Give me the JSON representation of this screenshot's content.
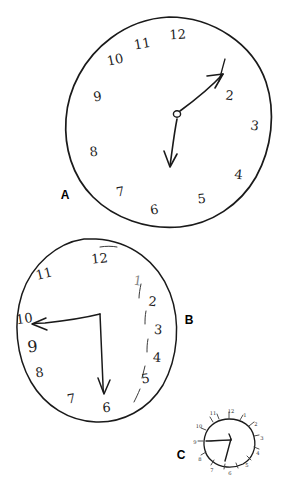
{
  "figure": {
    "background_color": "#ffffff",
    "ink_color": "#1a1a1a",
    "panels": [
      {
        "label": "A",
        "label_x": 65,
        "label_y": 199,
        "shape": "circle",
        "numbers": [
          "12",
          "1",
          "2",
          "3",
          "4",
          "5",
          "6",
          "7",
          "8",
          "9",
          "10",
          "11"
        ],
        "hands": [
          "long hand to 1",
          "short hand to 6"
        ],
        "hand_style": "arrow"
      },
      {
        "label": "B",
        "label_x": 189,
        "label_y": 324,
        "shape": "oval",
        "numbers": [
          "12",
          "1",
          "2",
          "3",
          "4",
          "5",
          "6",
          "7",
          "8",
          "9",
          "10",
          "11"
        ],
        "hands": [
          "arrow to 10",
          "arrow to 6"
        ],
        "hand_style": "arrow, bent, off-center"
      },
      {
        "label": "C",
        "label_x": 181,
        "label_y": 459,
        "shape": "small circle with tick marks",
        "numbers": [
          "12",
          "1",
          "2",
          "3",
          "4",
          "5",
          "6",
          "7",
          "8",
          "9",
          "10",
          "11"
        ],
        "hands": [
          "long hand to 9",
          "short hand to 6"
        ],
        "hand_style": "plain"
      }
    ]
  },
  "clock_a": {
    "label": "A",
    "cx": 169,
    "cy": 122,
    "rx": 103,
    "ry": 105,
    "numerals": [
      {
        "text": "12",
        "x": 178,
        "y": 39
      },
      {
        "text": "2",
        "x": 229,
        "y": 100
      },
      {
        "text": "3",
        "x": 254,
        "y": 130
      },
      {
        "text": "4",
        "x": 238,
        "y": 179
      },
      {
        "text": "5",
        "x": 202,
        "y": 203
      },
      {
        "text": "6",
        "x": 155,
        "y": 214
      },
      {
        "text": "7",
        "x": 121,
        "y": 196
      },
      {
        "text": "8",
        "x": 94,
        "y": 156
      },
      {
        "text": "9",
        "x": 98,
        "y": 101
      },
      {
        "text": "10",
        "x": 116,
        "y": 64
      },
      {
        "text": "11",
        "x": 143,
        "y": 48
      }
    ],
    "hub": {
      "x": 177,
      "y": 114,
      "r": 3.4
    },
    "hand_long": {
      "to_x": 222,
      "to_y": 72,
      "points_to": "1"
    },
    "hand_short": {
      "to_x": 170,
      "to_y": 166,
      "points_to": "6"
    },
    "one_tick": {
      "x1": 224,
      "y1": 60,
      "x2": 219,
      "y2": 80
    }
  },
  "clock_b": {
    "label": "B",
    "cx": 94,
    "cy": 331,
    "rx": 80,
    "ry": 92,
    "numerals": [
      {
        "text": "12",
        "x": 100,
        "y": 262
      },
      {
        "text": "1",
        "x": 137,
        "y": 283,
        "faint": true
      },
      {
        "text": "2",
        "x": 152,
        "y": 305
      },
      {
        "text": "3",
        "x": 158,
        "y": 333
      },
      {
        "text": "4",
        "x": 157,
        "y": 361
      },
      {
        "text": "5",
        "x": 146,
        "y": 382
      },
      {
        "text": "6",
        "x": 107,
        "y": 410
      },
      {
        "text": "7",
        "x": 72,
        "y": 402
      },
      {
        "text": "8",
        "x": 40,
        "y": 376
      },
      {
        "text": "9",
        "x": 32,
        "y": 350
      },
      {
        "text": "10",
        "x": 24,
        "y": 322
      },
      {
        "text": "11",
        "x": 44,
        "y": 277
      }
    ],
    "hand_to_10": {
      "from_x": 100,
      "from_y": 315,
      "to_x": 33,
      "to_y": 324
    },
    "hand_to_6": {
      "from_x": 100,
      "from_y": 315,
      "to_x": 104,
      "to_y": 393
    },
    "tick_count": 5
  },
  "clock_c": {
    "label": "C",
    "cx": 229,
    "cy": 443,
    "rx": 25,
    "ry": 24,
    "numerals": [
      {
        "text": "12",
        "x": 229,
        "y": 414
      },
      {
        "text": "1",
        "x": 244,
        "y": 418
      },
      {
        "text": "2",
        "x": 255,
        "y": 428
      },
      {
        "text": "3",
        "x": 260,
        "y": 443
      },
      {
        "text": "4",
        "x": 256,
        "y": 458
      },
      {
        "text": "5",
        "x": 245,
        "y": 469
      },
      {
        "text": "6",
        "x": 229,
        "y": 474
      },
      {
        "text": "7",
        "x": 212,
        "y": 470
      },
      {
        "text": "8",
        "x": 201,
        "y": 459
      },
      {
        "text": "9",
        "x": 197,
        "y": 443
      },
      {
        "text": "10",
        "x": 201,
        "y": 427
      },
      {
        "text": "11",
        "x": 213,
        "y": 417
      }
    ],
    "hand_long": {
      "to_x": 206,
      "to_y": 441,
      "points_to": "9"
    },
    "hand_short": {
      "to_x": 225,
      "to_y": 461,
      "points_to": "6"
    },
    "hub": {
      "x": 230,
      "y": 440
    }
  }
}
